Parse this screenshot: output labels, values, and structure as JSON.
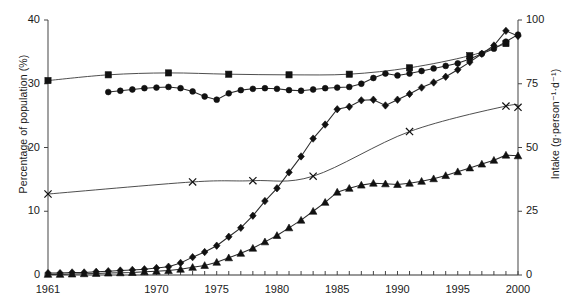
{
  "chart_data": {
    "type": "line",
    "title": "",
    "xlabel": "",
    "ylabel": "Percentage of population (%)",
    "y2label": "Intake (g·person⁻¹·d⁻¹)",
    "xlim": [
      1961,
      2000
    ],
    "ylim": [
      0,
      40
    ],
    "y2lim": [
      0,
      100
    ],
    "grid": false,
    "legend": "none",
    "xticks": [
      1961,
      1970,
      1975,
      1980,
      1985,
      1990,
      1995,
      2000
    ],
    "xtick_labels": [
      "1961",
      "1970",
      "1975",
      "1980",
      "1985",
      "1990",
      "1995",
      "2000"
    ],
    "xminor_ticks_every": 1,
    "yticks": [
      0,
      10,
      20,
      30,
      40
    ],
    "ytick_labels": [
      "0",
      "10",
      "20",
      "30",
      "40"
    ],
    "y2ticks": [
      0,
      25,
      50,
      75,
      100
    ],
    "y2tick_labels": [
      "0",
      "25",
      "50",
      "75",
      "100"
    ],
    "series": [
      {
        "name": "square-series",
        "marker": "square",
        "axis": "left",
        "x": [
          1961,
          1966,
          1971,
          1976,
          1981,
          1986,
          1991,
          1996,
          1999
        ],
        "values": [
          30.5,
          31.4,
          31.7,
          31.5,
          31.4,
          31.5,
          32.5,
          34.4,
          36.3
        ],
        "smooth": true
      },
      {
        "name": "circle-series",
        "marker": "circle",
        "axis": "left",
        "x": [
          1966,
          1967,
          1968,
          1969,
          1970,
          1971,
          1972,
          1973,
          1974,
          1975,
          1976,
          1977,
          1978,
          1979,
          1980,
          1981,
          1982,
          1983,
          1984,
          1985,
          1986,
          1987,
          1988,
          1989,
          1990,
          1991,
          1992,
          1993,
          1994,
          1995,
          1996,
          1997,
          1998,
          1999,
          2000
        ],
        "values": [
          28.7,
          28.9,
          29.1,
          29.3,
          29.4,
          29.5,
          29.3,
          28.8,
          28.0,
          27.5,
          28.5,
          29.0,
          29.2,
          29.3,
          29.2,
          29.0,
          28.9,
          29.1,
          29.3,
          29.4,
          29.5,
          30.0,
          30.9,
          31.6,
          31.3,
          31.6,
          32.0,
          32.4,
          32.8,
          33.2,
          33.9,
          34.7,
          35.5,
          36.6,
          37.7
        ],
        "smooth": false
      },
      {
        "name": "x-series",
        "marker": "x",
        "axis": "left",
        "x": [
          1961,
          1973,
          1978,
          1983,
          1991,
          1999,
          2000
        ],
        "values": [
          12.7,
          14.6,
          14.8,
          15.5,
          22.5,
          26.5,
          26.3
        ],
        "smooth": true
      },
      {
        "name": "diamond-series",
        "marker": "diamond",
        "axis": "left",
        "x": [
          1961,
          1962,
          1963,
          1964,
          1965,
          1966,
          1967,
          1968,
          1969,
          1970,
          1971,
          1972,
          1973,
          1974,
          1975,
          1976,
          1977,
          1978,
          1979,
          1980,
          1981,
          1982,
          1983,
          1984,
          1985,
          1986,
          1987,
          1988,
          1989,
          1990,
          1991,
          1992,
          1993,
          1994,
          1995,
          1996,
          1997,
          1998,
          1999,
          2000
        ],
        "values": [
          0.3,
          0.3,
          0.4,
          0.4,
          0.5,
          0.6,
          0.7,
          0.8,
          0.9,
          1.1,
          1.3,
          1.9,
          2.8,
          3.6,
          4.6,
          6.0,
          7.4,
          9.3,
          11.6,
          13.6,
          16.1,
          18.6,
          21.4,
          23.6,
          26.0,
          26.4,
          27.4,
          27.5,
          26.6,
          27.5,
          28.4,
          29.4,
          30.2,
          31.1,
          32.2,
          33.4,
          34.7,
          36.0,
          38.3,
          37.5
        ],
        "smooth": false
      },
      {
        "name": "triangle-series",
        "marker": "triangle",
        "axis": "left",
        "x": [
          1961,
          1962,
          1963,
          1964,
          1965,
          1966,
          1967,
          1968,
          1969,
          1970,
          1971,
          1972,
          1973,
          1974,
          1975,
          1976,
          1977,
          1978,
          1979,
          1980,
          1981,
          1982,
          1983,
          1984,
          1985,
          1986,
          1987,
          1988,
          1989,
          1990,
          1991,
          1992,
          1993,
          1994,
          1995,
          1996,
          1997,
          1998,
          1999,
          2000
        ],
        "values": [
          0.1,
          0.1,
          0.15,
          0.2,
          0.25,
          0.3,
          0.35,
          0.4,
          0.5,
          0.6,
          0.7,
          0.9,
          1.2,
          1.5,
          2.0,
          2.7,
          3.4,
          4.2,
          5.2,
          6.2,
          7.4,
          8.6,
          10.0,
          11.4,
          13.0,
          13.6,
          14.1,
          14.4,
          14.3,
          14.2,
          14.4,
          14.7,
          15.1,
          15.6,
          16.2,
          16.8,
          17.4,
          18.0,
          18.8,
          18.7
        ],
        "smooth": false
      }
    ]
  },
  "axes": {
    "left_title": "Percentage of population (%)",
    "right_title": "Intake (g·person⁻¹·d⁻¹)"
  }
}
